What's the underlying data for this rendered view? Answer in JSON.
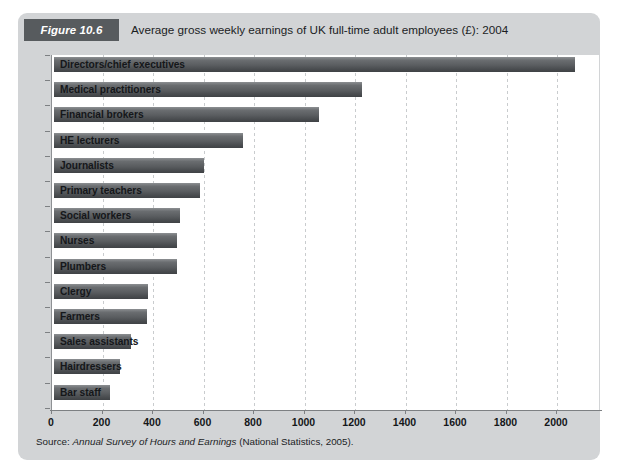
{
  "figure": {
    "badge": "Figure 10.6",
    "title": "Average gross weekly earnings of UK full-time adult employees (£): 2004",
    "source_label": "Source:",
    "source_title": "Annual Survey of Hours and Earnings",
    "source_publisher": "(National Statistics, 2005)."
  },
  "colors": {
    "panel_background": "#d2d4d6",
    "badge_background": "#575b5e",
    "plot_background": "#ffffff",
    "bar_dark": "#3f4245",
    "bar_light": "#8c8f92",
    "axis": "#7d8083",
    "gridline": "#c9ccce",
    "text": "#15171a"
  },
  "chart_data": {
    "type": "bar",
    "orientation": "horizontal",
    "title": "Average gross weekly earnings of UK full-time adult employees (£): 2004",
    "xlabel": "",
    "ylabel": "",
    "xlim": [
      0,
      2120
    ],
    "grid": true,
    "legend": null,
    "xticks": [
      0,
      200,
      400,
      600,
      800,
      1000,
      1200,
      1400,
      1600,
      1800,
      2000
    ],
    "xtick_labels": [
      "0",
      "200",
      "400",
      "600",
      "800",
      "1000",
      "1200",
      "1400",
      "1600",
      "1800",
      "2000"
    ],
    "categories": [
      "Directors/chief executives",
      "Medical practitioners",
      "Financial brokers",
      "HE lecturers",
      "Journalists",
      "Primary teachers",
      "Social workers",
      "Nurses",
      "Plumbers",
      "Clergy",
      "Farmers",
      "Sales assistants",
      "Hairdressers",
      "Bar staff"
    ],
    "values": [
      2065,
      1220,
      1050,
      750,
      595,
      580,
      500,
      487,
      487,
      373,
      368,
      305,
      262,
      222
    ]
  }
}
